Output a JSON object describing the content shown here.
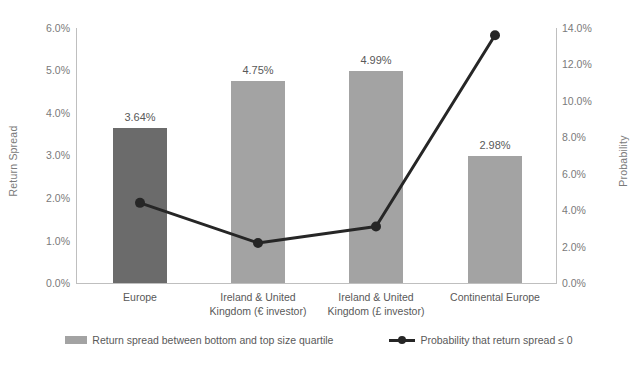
{
  "chart_data": {
    "type": "bar",
    "title": "",
    "categories": [
      "Europe",
      "Ireland & United\nKingdom (€ investor)",
      "Ireland & United\nKingdom (£ investor)",
      "Continental Europe"
    ],
    "series": [
      {
        "name": "Return spread between bottom and top size quartile",
        "type": "bar",
        "axis": "left",
        "values": [
          3.64,
          4.75,
          4.99,
          2.98
        ],
        "labels": [
          "3.64%",
          "4.75%",
          "4.99%",
          "2.98%"
        ],
        "colors": [
          "#6b6b6b",
          "#a3a3a3",
          "#a3a3a3",
          "#a3a3a3"
        ]
      },
      {
        "name": "Probability that return spread ≤ 0",
        "type": "line",
        "axis": "right",
        "values": [
          4.4,
          2.2,
          3.1,
          13.6
        ],
        "color": "#262626"
      }
    ],
    "xlabel": "",
    "ylabel": "Return Spread",
    "y2label": "Probability",
    "ylim": [
      0,
      6
    ],
    "y2lim": [
      0,
      14
    ],
    "grid": false,
    "legend_position": "bottom"
  },
  "axes": {
    "left": {
      "title": "Return Spread",
      "ticks": [
        "6.0%",
        "5.0%",
        "4.0%",
        "3.0%",
        "2.0%",
        "1.0%",
        "0.0%"
      ]
    },
    "right": {
      "title": "Probability",
      "ticks": [
        "14.0%",
        "12.0%",
        "10.0%",
        "8.0%",
        "6.0%",
        "4.0%",
        "2.0%",
        "0.0%"
      ]
    }
  },
  "legend": {
    "items": [
      {
        "label": "Return spread between bottom and top size quartile",
        "marker": "bar-swatch-icon",
        "color": "#a3a3a3"
      },
      {
        "label": "Probability that return spread ≤ 0",
        "marker": "line-marker-icon",
        "color": "#262626"
      }
    ]
  }
}
